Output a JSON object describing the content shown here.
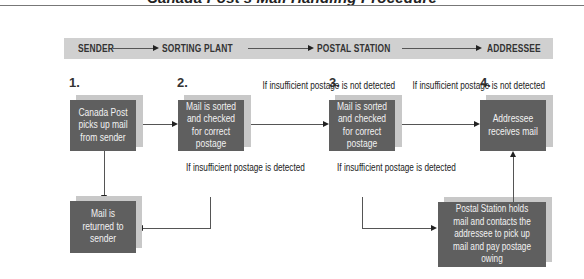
{
  "title": "Canada Post's Mail Handling Procedure",
  "stages": [
    "SENDER",
    "SORTING PLANT",
    "POSTAL STATION",
    "ADDRESSEE"
  ],
  "steps": [
    {
      "number": "1.",
      "text": "Canada Post picks up mail from sender"
    },
    {
      "number": "2.",
      "text": "Mail is sorted and checked for correct postage"
    },
    {
      "number": "3.",
      "text": "Mail is sorted and checked for correct postage"
    },
    {
      "number": "4.",
      "text": "Addressee receives mail"
    }
  ],
  "outcomes": {
    "returned": "Mail is returned to sender",
    "held": "Postal Station holds mail and contacts the addressee to pick up mail and pay postage owing"
  },
  "notes": {
    "not_detected_1": "If insufficient postage is not detected",
    "not_detected_2": "If insufficient postage is not detected",
    "detected_1": "If insufficient postage is detected",
    "detected_2": "If insufficient postage is detected"
  },
  "colors": {
    "box": "#5f5f5f",
    "shadow": "#c8c8c8",
    "stage_bar": "#d0d0d0",
    "text_on_box": "#f2f2f2"
  }
}
